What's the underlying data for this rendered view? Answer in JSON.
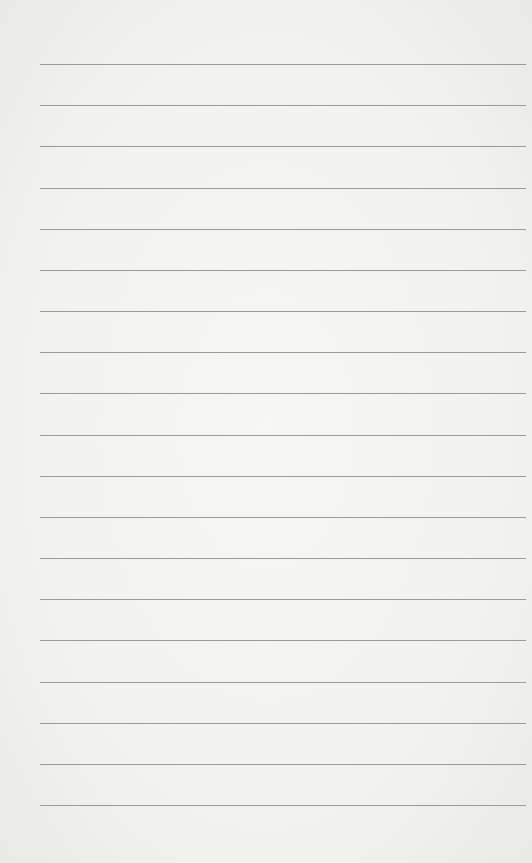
{
  "paper": {
    "background": "#f3f3f2",
    "line_color": "#9a9a9a",
    "line_count": 19,
    "first_line_y": 64,
    "line_spacing": 41.17,
    "line_left": 40,
    "line_width": 486
  }
}
